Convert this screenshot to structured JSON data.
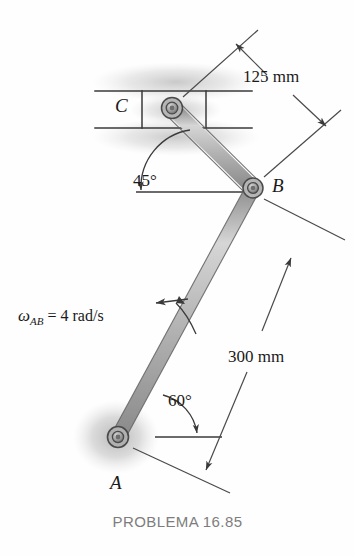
{
  "figure": {
    "caption": "PROBLEMA 16.85",
    "background_color": "#fefefe",
    "line_color": "#3a3a3a",
    "link_fill_color": "#b9b9b9",
    "shading_color": "#9a9a9a"
  },
  "points": [
    {
      "id": "A",
      "label": "A",
      "x": 118,
      "y": 437,
      "type": "fixed-pivot"
    },
    {
      "id": "B",
      "label": "B",
      "x": 253,
      "y": 188,
      "type": "pin-joint"
    },
    {
      "id": "C",
      "label": "C",
      "x": 172,
      "y": 108,
      "type": "slider-pin"
    }
  ],
  "dimensions": [
    {
      "id": "dim-bc",
      "value": "125 mm",
      "members": "B to C"
    },
    {
      "id": "dim-ab",
      "value": "300 mm",
      "members": "A to B"
    }
  ],
  "angles": [
    {
      "id": "angle-bc",
      "value": "45°",
      "at": "link BC to horizontal"
    },
    {
      "id": "angle-ab",
      "value": "60°",
      "at": "link AB to horizontal"
    }
  ],
  "annotations": {
    "angular_velocity": {
      "symbol": "ω",
      "subscript": "AB",
      "equals": "=",
      "value": "4 rad/s",
      "full_text": "ωAB = 4 rad/s"
    }
  },
  "icons": {
    "rotation_arrow": "curved-rotation-arrow-icon",
    "dimension_arrow": "dimension-arrow-icon",
    "angle_arrow": "angle-arc-arrow-icon"
  }
}
